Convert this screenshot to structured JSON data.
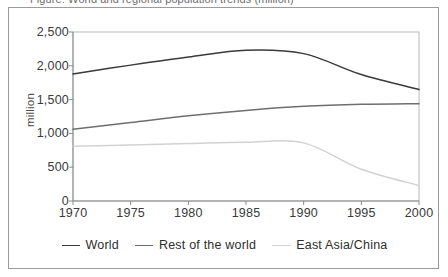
{
  "figure": {
    "clipped_caption": "Figure: World and regional population trends (million)"
  },
  "chart_data": {
    "type": "line",
    "title": "",
    "xlabel": "",
    "ylabel": "million",
    "xlim": [
      1970,
      2000
    ],
    "ylim": [
      0,
      2500
    ],
    "yticks": [
      "0",
      "500",
      "1,000",
      "1,500",
      "2,000",
      "2,500"
    ],
    "ytick_values": [
      0,
      500,
      1000,
      1500,
      2000,
      2500
    ],
    "xticks": [
      "1970",
      "1975",
      "1980",
      "1985",
      "1990",
      "1995",
      "2000"
    ],
    "xtick_values": [
      1970,
      1975,
      1980,
      1985,
      1990,
      1995,
      2000
    ],
    "grid": false,
    "legend_position": "bottom",
    "x": [
      1970,
      1975,
      1980,
      1985,
      1990,
      1995,
      2000
    ],
    "series": [
      {
        "name": "World",
        "color": "#3a3a3a",
        "values": [
          1880,
          2010,
          2130,
          2230,
          2180,
          1870,
          1650
        ]
      },
      {
        "name": "Rest of the world",
        "color": "#6e6e6e",
        "values": [
          1060,
          1160,
          1260,
          1340,
          1400,
          1430,
          1440
        ]
      },
      {
        "name": "East Asia/China",
        "color": "#d2d2d2",
        "values": [
          810,
          830,
          850,
          870,
          860,
          470,
          230
        ]
      }
    ]
  },
  "legend": {
    "items": [
      {
        "label": "World",
        "color": "#3a3a3a"
      },
      {
        "label": "Rest of the world",
        "color": "#6e6e6e"
      },
      {
        "label": "East Asia/China",
        "color": "#d2d2d2"
      }
    ]
  },
  "colors": {
    "frame_border": "#9b9b9b",
    "plot_border": "#b8b8b8",
    "axis": "#8a8a8a",
    "background": "#ffffff",
    "text": "#3a3a3a"
  }
}
